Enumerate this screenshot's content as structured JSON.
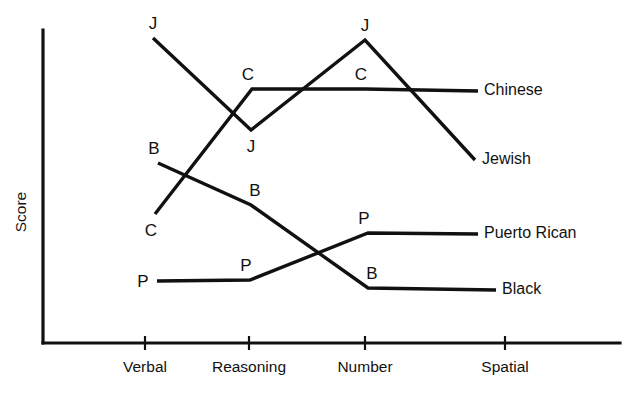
{
  "chart_data": {
    "type": "line",
    "title": "",
    "xlabel": "",
    "ylabel": "Score",
    "grid": false,
    "legend_position": "right-inline-end-of-line",
    "categories": [
      "Verbal",
      "Reasoning",
      "Number",
      "Spatial"
    ],
    "marker_style": "first-letter-of-series-name",
    "axis": {
      "y_axis_has_ticks": false,
      "y_axis_has_numbers": false,
      "x_tick_count": 4
    },
    "series": [
      {
        "name": "Jewish",
        "marker": "J",
        "values": [
          95,
          68,
          94,
          56
        ],
        "points_px": [
          [
            153,
            38
          ],
          [
            251,
            130
          ],
          [
            365,
            40
          ],
          [
            475,
            160
          ]
        ],
        "marker_points": [
          [
            153,
            38
          ],
          [
            251,
            130
          ],
          [
            365,
            40
          ]
        ],
        "marker_label_offsets": [
          [
            0,
            -9
          ],
          [
            0,
            22
          ],
          [
            0,
            -9
          ]
        ],
        "end_label_x": 482,
        "end_label_y": 160
      },
      {
        "name": "Chinese",
        "marker": "C",
        "values": [
          41,
          81,
          81,
          81
        ],
        "points_px": [
          [
            155,
            214
          ],
          [
            252,
            89
          ],
          [
            365,
            89
          ],
          [
            478,
            91
          ]
        ],
        "marker_points": [
          [
            155,
            214
          ],
          [
            252,
            89
          ],
          [
            365,
            89
          ]
        ],
        "marker_label_offsets": [
          [
            -4,
            22
          ],
          [
            -4,
            -9
          ],
          [
            -4,
            -9
          ]
        ],
        "end_label_x": 484,
        "end_label_y": 91
      },
      {
        "name": "Black",
        "marker": "B",
        "values": [
          58,
          45,
          18,
          18
        ],
        "points_px": [
          [
            158,
            163
          ],
          [
            251,
            205
          ],
          [
            368,
            288
          ],
          [
            496,
            290
          ]
        ],
        "marker_points": [
          [
            158,
            163
          ],
          [
            251,
            205
          ],
          [
            368,
            288
          ]
        ],
        "marker_label_offsets": [
          [
            -4,
            -9
          ],
          [
            4,
            -9
          ],
          [
            4,
            -9
          ]
        ],
        "end_label_x": 502,
        "end_label_y": 290
      },
      {
        "name": "Puerto Rican",
        "marker": "P",
        "values": [
          22,
          22,
          36,
          36
        ],
        "points_px": [
          [
            157,
            281
          ],
          [
            250,
            280
          ],
          [
            368,
            233
          ],
          [
            478,
            234
          ]
        ],
        "marker_points": [
          [
            157,
            281
          ],
          [
            250,
            280
          ],
          [
            368,
            233
          ]
        ],
        "marker_label_offsets": [
          [
            -14,
            6
          ],
          [
            -4,
            -9
          ],
          [
            -4,
            -9
          ]
        ],
        "end_label_x": 484,
        "end_label_y": 234
      }
    ],
    "geometry": {
      "y_axis_x": 43,
      "y_axis_top": 30,
      "x_axis_y": 343,
      "x_axis_left": 43,
      "x_axis_right": 620,
      "tick_x": [
        145,
        249,
        365,
        505
      ],
      "tick_top": 336,
      "tick_bottom": 350,
      "tick_label_y": 372,
      "y_title_x": 26,
      "y_title_y": 212
    },
    "colors": {
      "ink": "#111111",
      "background": "#ffffff"
    }
  }
}
